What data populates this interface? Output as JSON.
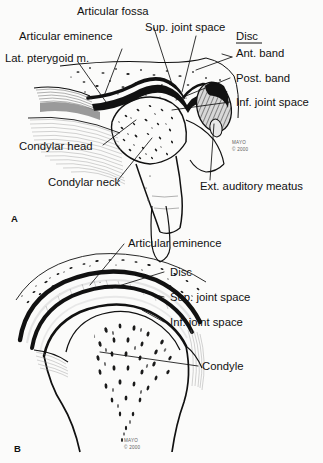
{
  "figure": {
    "background_color": "#fbfbfa",
    "ink_color": "#111111",
    "panels": [
      {
        "id": "A",
        "label": "A",
        "view": "sagittal, mouth closed"
      },
      {
        "id": "B",
        "label": "B",
        "view": "sagittal, detail of condyle and disc"
      }
    ]
  },
  "panel_a": {
    "label": "A",
    "labels": [
      {
        "id": "articular-fossa",
        "text": "Articular fossa"
      },
      {
        "id": "sup-joint-space",
        "text": "Sup. joint space"
      },
      {
        "id": "articular-eminence",
        "text": "Articular eminence"
      },
      {
        "id": "lat-pterygoid",
        "text": "Lat. pterygoid m."
      },
      {
        "id": "disc",
        "text": "Disc",
        "underlined": true
      },
      {
        "id": "ant-band",
        "text": "Ant. band"
      },
      {
        "id": "post-band",
        "text": "Post. band"
      },
      {
        "id": "inf-joint-space",
        "text": "Inf. joint space"
      },
      {
        "id": "condylar-head",
        "text": "Condylar head"
      },
      {
        "id": "condylar-neck",
        "text": "Condylar neck"
      },
      {
        "id": "ext-auditory-meatus",
        "text": "Ext. auditory meatus"
      }
    ],
    "credit": {
      "line1": "MAYO",
      "line2": "© 2000"
    }
  },
  "panel_b": {
    "label": "B",
    "labels": [
      {
        "id": "articular-eminence",
        "text": "Articular eminence"
      },
      {
        "id": "disc",
        "text": "Disc"
      },
      {
        "id": "sup-joint-space",
        "text": "Sup. joint space"
      },
      {
        "id": "inf-joint-space",
        "text": "Inf. joint space"
      },
      {
        "id": "condyle",
        "text": "Condyle"
      }
    ],
    "credit": {
      "line1": "MAYO",
      "line2": "© 2000"
    }
  },
  "caption": {
    "text": ""
  }
}
